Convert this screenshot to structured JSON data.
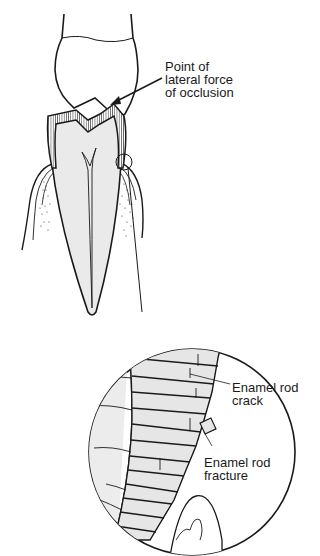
{
  "diagram": {
    "type": "anatomical illustration",
    "colors": {
      "line": "#1a1a1a",
      "fill": "#ececec",
      "background": "#ffffff"
    },
    "labels": {
      "force_point": {
        "line1": "Point of",
        "line2": "lateral force",
        "line3": "of occlusion"
      },
      "rod_crack": {
        "line1": "Enamel rod",
        "line2": "crack"
      },
      "rod_fracture": {
        "line1": "Enamel rod",
        "line2": "fracture"
      }
    }
  }
}
